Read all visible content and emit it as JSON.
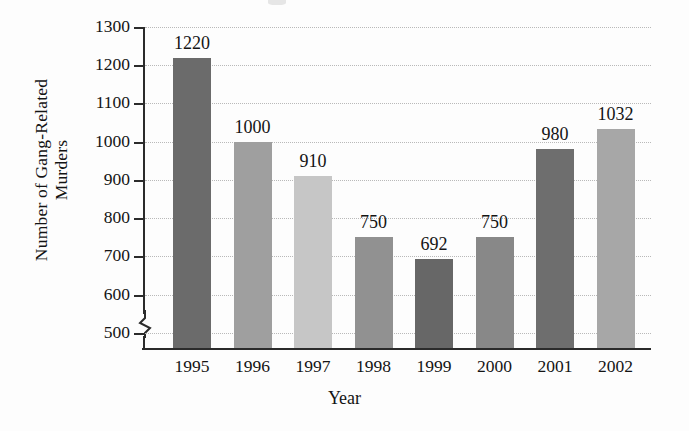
{
  "chart_data": {
    "type": "bar",
    "title": "",
    "xlabel": "Year",
    "ylabel": "Number of Gang-Related Murders",
    "ylabel_lines": [
      "Number of Gang-Related",
      "Murders"
    ],
    "categories": [
      "1995",
      "1996",
      "1997",
      "1998",
      "1999",
      "2000",
      "2001",
      "2002"
    ],
    "values": [
      1220,
      1000,
      910,
      750,
      692,
      750,
      980,
      1032
    ],
    "value_labels": [
      "1220",
      "1000",
      "910",
      "750",
      "692",
      "750",
      "980",
      "1032"
    ],
    "ylim": [
      460,
      1300
    ],
    "y_ticks": [
      500,
      600,
      700,
      800,
      900,
      1000,
      1100,
      1200,
      1300
    ],
    "y_tick_labels": [
      "500",
      "600",
      "700",
      "800",
      "900",
      "1000",
      "1100",
      "1200",
      "1300"
    ],
    "axis_break": true,
    "axis_break_below": 500,
    "grid": true,
    "grid_style": "dotted",
    "legend": "none",
    "bar_colors": [
      "#6b6b6b",
      "#9f9f9f",
      "#c6c6c6",
      "#919191",
      "#676767",
      "#888888",
      "#6e6e6e",
      "#a7a7a7"
    ]
  },
  "style": {
    "background": "#fdfdfd",
    "axis_color": "#2b2b2b",
    "grid_color": "#b9b9b9",
    "text_color": "#141414"
  }
}
